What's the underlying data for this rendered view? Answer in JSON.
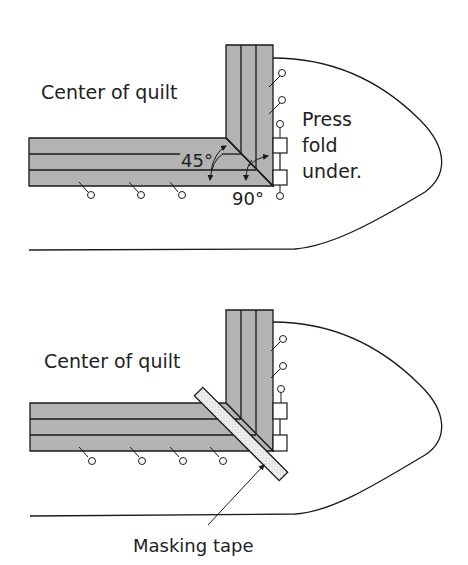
{
  "top": {
    "center_label": "Center of quilt",
    "angle_45": "45°",
    "angle_90": "90°",
    "note_line1": "Press",
    "note_line2": "fold",
    "note_line3": "under."
  },
  "bottom": {
    "center_label": "Center of quilt",
    "callout": "Masking tape"
  },
  "colors": {
    "strip_fill": "#b3b3b3",
    "line": "#1a1a1a",
    "tape_fill": "#f2f2f2"
  }
}
